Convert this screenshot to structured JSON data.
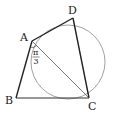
{
  "figure": {
    "points": {
      "A": {
        "label": "A",
        "x": 32,
        "y": 41
      },
      "B": {
        "label": "B",
        "x": 16,
        "y": 98
      },
      "C": {
        "label": "C",
        "x": 89,
        "y": 98
      },
      "D": {
        "label": "D",
        "x": 73,
        "y": 18
      }
    },
    "circle": {
      "cx": 68,
      "cy": 62,
      "r": 37
    },
    "angle_label": {
      "numerator": "π",
      "denominator": "3"
    },
    "colors": {
      "stroke_main": "#222222",
      "stroke_thin": "#666666",
      "circle": "#888888"
    }
  }
}
